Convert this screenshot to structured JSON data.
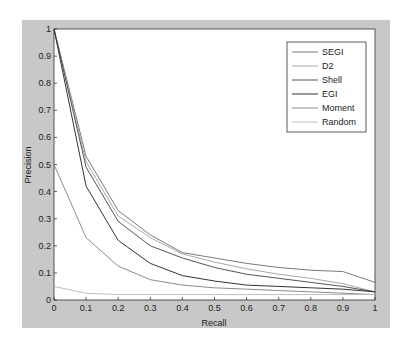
{
  "chart_data": {
    "type": "line",
    "title": "",
    "xlabel": "Recall",
    "ylabel": "Precision",
    "xlim": [
      0,
      1
    ],
    "ylim": [
      0,
      1
    ],
    "grid": false,
    "legend_position": "upper right",
    "x": [
      0,
      0.1,
      0.2,
      0.3,
      0.4,
      0.5,
      0.6,
      0.7,
      0.8,
      0.9,
      1.0
    ],
    "x_ticks": [
      "0",
      "0.1",
      "0.2",
      "0.3",
      "0.4",
      "0.5",
      "0.6",
      "0.7",
      "0.8",
      "0.9",
      "1"
    ],
    "y_ticks": [
      "0",
      "0.1",
      "0.2",
      "0.3",
      "0.4",
      "0.5",
      "0.6",
      "0.7",
      "0.8",
      "0.9",
      "1"
    ],
    "series": [
      {
        "name": "SEGI",
        "color": "#7a7a7a",
        "values": [
          1.0,
          0.53,
          0.33,
          0.24,
          0.175,
          0.155,
          0.135,
          0.12,
          0.11,
          0.105,
          0.065
        ]
      },
      {
        "name": "D2",
        "color": "#a8a8a8",
        "values": [
          1.0,
          0.51,
          0.31,
          0.23,
          0.17,
          0.14,
          0.115,
          0.095,
          0.08,
          0.06,
          0.03
        ]
      },
      {
        "name": "Shell",
        "color": "#555555",
        "values": [
          1.0,
          0.49,
          0.29,
          0.2,
          0.155,
          0.12,
          0.095,
          0.08,
          0.065,
          0.05,
          0.03
        ]
      },
      {
        "name": "EGI",
        "color": "#333333",
        "values": [
          1.0,
          0.42,
          0.22,
          0.135,
          0.09,
          0.07,
          0.055,
          0.05,
          0.045,
          0.04,
          0.03
        ]
      },
      {
        "name": "Moment",
        "color": "#8c8c8c",
        "values": [
          0.5,
          0.23,
          0.125,
          0.075,
          0.055,
          0.045,
          0.04,
          0.035,
          0.03,
          0.025,
          0.02
        ]
      },
      {
        "name": "Random",
        "color": "#bdbdbd",
        "values": [
          0.05,
          0.025,
          0.02,
          0.02,
          0.02,
          0.02,
          0.02,
          0.02,
          0.02,
          0.02,
          0.02
        ]
      }
    ]
  }
}
